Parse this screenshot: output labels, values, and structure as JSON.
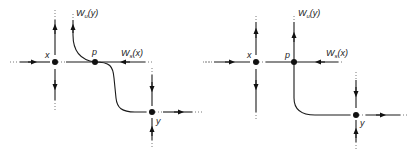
{
  "diagrams": [
    {
      "id": "left",
      "labels": {
        "x": "x",
        "p": "p",
        "y": "y",
        "wu": "W",
        "wu_sub": "u",
        "wu_arg": "(y)",
        "ws": "W",
        "ws_sub": "s",
        "ws_arg": "(x)"
      },
      "description": "Heteroclinic connection p from x to y where unstable manifold Wu(y) and stable manifold Ws(x) intersect transversally"
    },
    {
      "id": "right",
      "labels": {
        "x": "x",
        "p": "p",
        "y": "y",
        "wu": "W",
        "wu_sub": "u",
        "wu_arg": "(y)",
        "ws": "W",
        "ws_sub": "s",
        "ws_arg": "(x)"
      },
      "description": "Heteroclinic point p with manifolds crossing at right angle"
    }
  ],
  "colors": {
    "line": "#1a1a1a",
    "background": "#ffffff"
  }
}
